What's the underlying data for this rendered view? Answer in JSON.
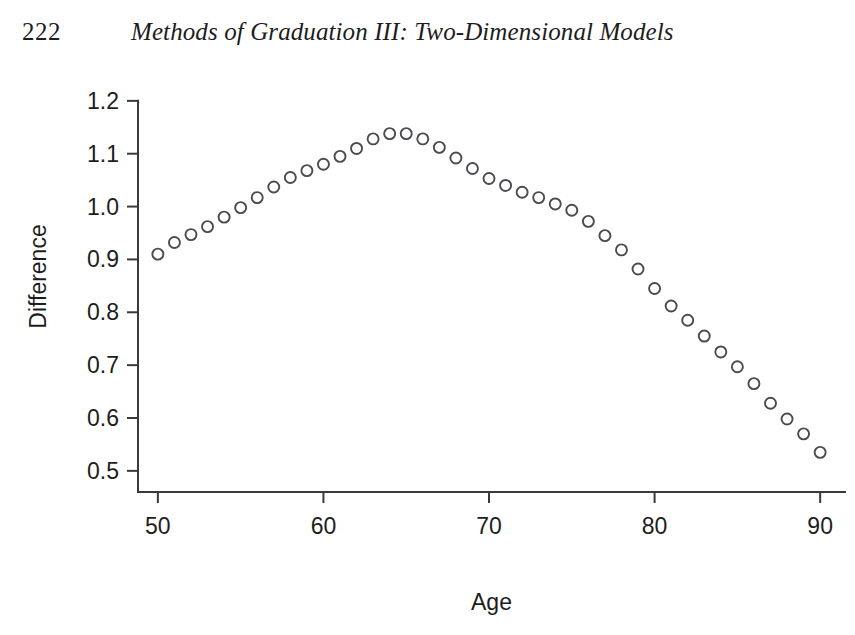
{
  "header": {
    "page_number": "222",
    "running_title": "Methods of Graduation III: Two-Dimensional Models"
  },
  "chart_data": {
    "type": "scatter",
    "title": "",
    "subtitle": "",
    "xlabel": "Age",
    "ylabel": "Difference",
    "xlim": [
      48.8,
      91.5
    ],
    "ylim": [
      0.46,
      1.23
    ],
    "xticks": [
      50,
      60,
      70,
      80,
      90
    ],
    "xtick_labels": [
      "50",
      "60",
      "70",
      "80",
      "90"
    ],
    "yticks": [
      0.5,
      0.6,
      0.7,
      0.8,
      0.9,
      1.0,
      1.1,
      1.2
    ],
    "ytick_labels": [
      "0.5",
      "0.6",
      "0.7",
      "0.8",
      "0.9",
      "1.0",
      "1.1",
      "1.2"
    ],
    "grid": false,
    "legend": null,
    "marker": "open-circle",
    "marker_color": "#4a4a52",
    "marker_size": 11,
    "x": [
      50,
      51,
      52,
      53,
      54,
      55,
      56,
      57,
      58,
      59,
      60,
      61,
      62,
      63,
      64,
      65,
      66,
      67,
      68,
      69,
      70,
      71,
      72,
      73,
      74,
      75,
      76,
      77,
      78,
      79,
      80,
      81,
      82,
      83,
      84,
      85,
      86,
      87,
      88,
      89
    ],
    "y": [
      0.91,
      0.932,
      0.947,
      0.962,
      0.98,
      0.998,
      1.017,
      1.037,
      1.055,
      1.068,
      1.08,
      1.095,
      1.11,
      1.128,
      1.138,
      1.138,
      1.128,
      1.112,
      1.092,
      1.072,
      1.053,
      1.04,
      1.027,
      1.017,
      1.005,
      0.993,
      0.972,
      0.945,
      0.918,
      0.882,
      0.845,
      0.812,
      0.785,
      0.755,
      0.725,
      0.697,
      0.665,
      0.628,
      0.598,
      0.57
    ],
    "last_point": {
      "x": 90,
      "y": 0.535
    },
    "point_count": 41
  },
  "axis_labels": {
    "x_title": "Age",
    "y_title": "Difference"
  }
}
